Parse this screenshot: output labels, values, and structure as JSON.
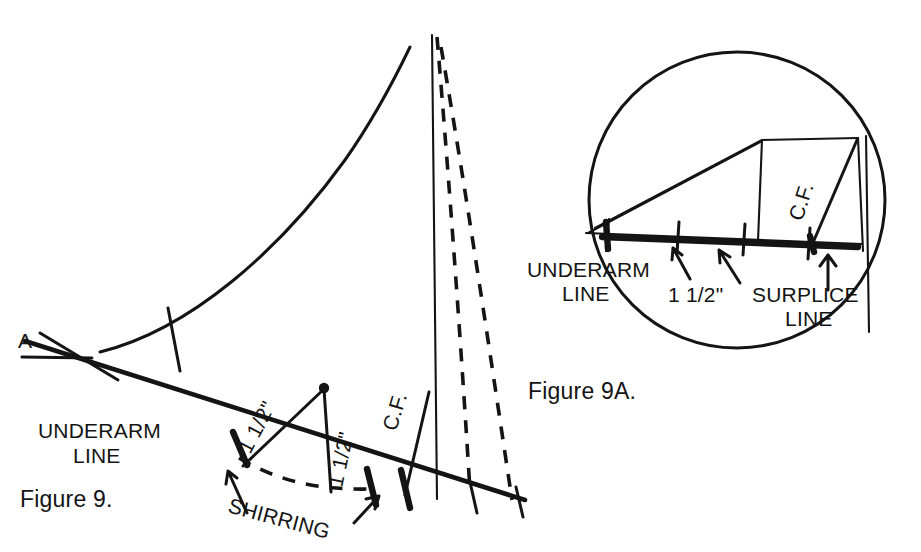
{
  "page": {
    "background_color": "#ffffff",
    "ink_color": "#141414",
    "width": 921,
    "height": 552
  },
  "figures": [
    {
      "id": "figure-9",
      "caption": "Figure 9.",
      "caption_position": {
        "x": 20,
        "y": 506
      },
      "labels": {
        "point_a": "A",
        "underarm_line_l1": "UNDERARM",
        "underarm_line_l2": "LINE",
        "measure_left": "1 1/2\"",
        "measure_right": "1 1/2\"",
        "shirring": "SHIRRING",
        "center_front": "C.F."
      }
    },
    {
      "id": "figure-9a",
      "caption": "Figure 9A.",
      "caption_position": {
        "x": 528,
        "y": 398
      },
      "labels": {
        "underarm_line_l1": "UNDERARM",
        "underarm_line_l2": "LINE",
        "measure": "1 1/2\"",
        "surplice_line_l1": "SURPLICE",
        "surplice_line_l2": "LINE",
        "center_front": "C.F."
      }
    }
  ],
  "geometry": {
    "figure9": {
      "armhole_curve": "M 100 352 C 190 330 280 250 345 160 C 378 113 398 72 410 47",
      "underarm_line": "M 25 341 L 525 500",
      "underarm_line_note": "long diagonal from upper-left to lower-right baseline",
      "point_a_cross": "M 22 357 L 92 358",
      "short_cross_upper": "M 40 333 L 118 380",
      "tick_on_curve": "M 168 308 L 180 371",
      "shirring_tick_left": "M 232 432 L 248 465",
      "shirring_tick_right": "M 367 469 L 376 505",
      "cf_tick": "M 401 469 L 410 507",
      "baseline_tick_1": "M 470 482 L 478 512",
      "baseline_tick_2": "M 516 487 L 523 516",
      "shirring_dart_left": "M 243 466 L 324 389",
      "shirring_dart_right": "M 324 389 L 331 492",
      "shirring_dashed": "M 239 458 C 280 481 320 489 371 489",
      "cf_vertical": "M 432 35 L 437 499",
      "cf_leader": "M 405 495 L 429 392",
      "dashed_inner": "M 437 37 C 450 190 462 360 470 491",
      "dashed_outer": "M 441 47 C 465 190 490 360 512 500",
      "apex_dot": {
        "cx": 324,
        "cy": 388,
        "r": 5.2
      },
      "arrow_shirring_left": "M 246 512 L 228 471",
      "arrow_shirring_left_head": "M 228 471 L 226 483 M 228 471 L 236 478",
      "arrow_shirring_right": "M 355 522 L 378 497",
      "arrow_shirring_right_head": "M 378 497 L 366 499 M 378 497 L 374 508"
    },
    "figure9a": {
      "circle": {
        "cx": 737,
        "cy": 200,
        "r": 148
      },
      "wedge_top": "M 595 228 L 762 140 L 858 138",
      "wedge_baseline_thin": "M 588 233 L 860 243",
      "wedge_baseline_thick": "M 600 236 L 858 246",
      "tip_left": "M 588 233 L 762 141",
      "vertical_1": "M 608 220 L 606 250",
      "vertical_2": "M 762 140 L 758 240",
      "right_edge": "M 858 138 L 862 250",
      "cf_leader": "M 812 244 L 857 140",
      "cf_vertical_outer": "M 866 138 L 868 330",
      "tick_a": "M 679 222 L 677 252",
      "tick_b": "M 745 224 L 743 254",
      "tick_c": "M 810 228 L 808 258",
      "arrow_1": "M 688 278 L 672 248",
      "arrow_1_head": "M 672 248 L 672 259 M 672 248 L 680 254",
      "arrow_2": "M 738 282 L 718 250",
      "arrow_2_head": "M 718 250 L 719 262 M 718 250 L 728 256",
      "arrow_3": "M 828 288 L 828 255",
      "arrow_3_head": "M 828 255 L 821 265 M 828 255 L 835 265"
    }
  }
}
